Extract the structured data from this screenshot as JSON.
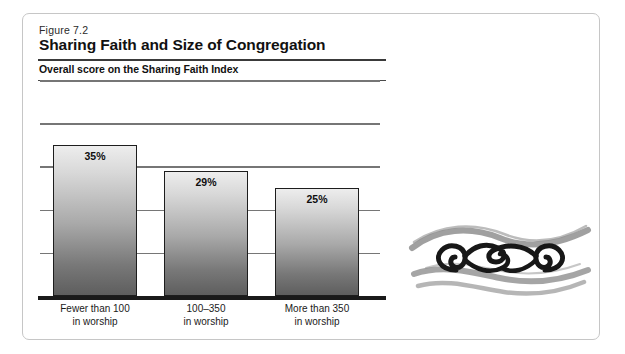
{
  "figure": {
    "number": "Figure 7.2",
    "title": "Sharing Faith and Size of Congregation",
    "subtitle": "Overall score on the Sharing Faith Index"
  },
  "ornament": {
    "name": "brush-stroke-spiral-ornament"
  },
  "chart_data": {
    "type": "bar",
    "title": "Sharing Faith and Size of Congregation",
    "subtitle": "Overall score on the Sharing Faith Index",
    "xlabel": "",
    "ylabel": "",
    "ylim": [
      0,
      50
    ],
    "grid": true,
    "gridlines": [
      10,
      20,
      30,
      40,
      50
    ],
    "legend": "none",
    "categories": [
      "Fewer than 100 in worship",
      "100–350 in worship",
      "More than 350 in worship"
    ],
    "category_lines": [
      [
        "Fewer than 100",
        "in worship"
      ],
      [
        "100–350",
        "in worship"
      ],
      [
        "More than 350",
        "in worship"
      ]
    ],
    "values": [
      35,
      29,
      25
    ],
    "value_labels": [
      "35%",
      "29%",
      "25%"
    ],
    "bar_fill": "#b4b4b4",
    "bar_border": "#1d1d1d",
    "axis_color": "#1a1a1a",
    "grid_color": "#767676"
  }
}
